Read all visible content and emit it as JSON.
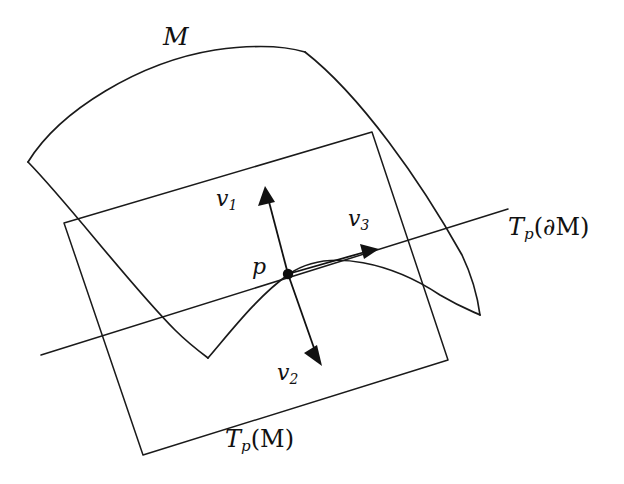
{
  "figure": {
    "background_color": "#ffffff",
    "stroke_color": "#1a1a1a",
    "width": 624,
    "height": 484
  },
  "labels": {
    "manifold": "M",
    "point": "p",
    "vector_1": "v",
    "vector_1_sub": "1",
    "vector_2": "v",
    "vector_2_sub": "2",
    "vector_3": "v",
    "vector_3_sub": "3",
    "tangent_boundary_prefix": "T",
    "tangent_boundary_sub": "p",
    "tangent_boundary_arg": "(∂M)",
    "tangent_manifold_prefix": "T",
    "tangent_manifold_sub": "p",
    "tangent_manifold_arg": "(M)"
  },
  "geometry": {
    "manifold_top_curve": "M28,162 C 60,110 140,62 215,50 C 258,44 285,46 305,52",
    "manifold_right_curve": "M305,52 C 360,95 420,180 462,255 C 472,276 478,300 480,315",
    "manifold_left_curve": "M28,162 C 70,205 130,285 175,330 C 188,343 200,352 208,358",
    "manifold_boundary_curve": "M208,358 C 232,330 258,296 289,274 C 330,246 395,265 440,295 C 462,308 474,312 480,315",
    "tangent_plane_corners": [
      {
        "x": 64,
        "y": 223
      },
      {
        "x": 372,
        "y": 132
      },
      {
        "x": 448,
        "y": 360
      },
      {
        "x": 143,
        "y": 455
      }
    ],
    "tangent_boundary_line": {
      "x1": 41,
      "y1": 355,
      "x2": 508,
      "y2": 209
    },
    "point_p": {
      "x": 288,
      "y": 274,
      "radius": 5.2
    },
    "vectors": [
      {
        "name": "v1",
        "from": {
          "x": 288,
          "y": 274
        },
        "to": {
          "x": 266,
          "y": 190
        }
      },
      {
        "name": "v2",
        "from": {
          "x": 288,
          "y": 274
        },
        "to": {
          "x": 322,
          "y": 366
        }
      },
      {
        "name": "v3",
        "from": {
          "x": 288,
          "y": 274
        },
        "to": {
          "x": 379,
          "y": 249
        }
      }
    ]
  }
}
